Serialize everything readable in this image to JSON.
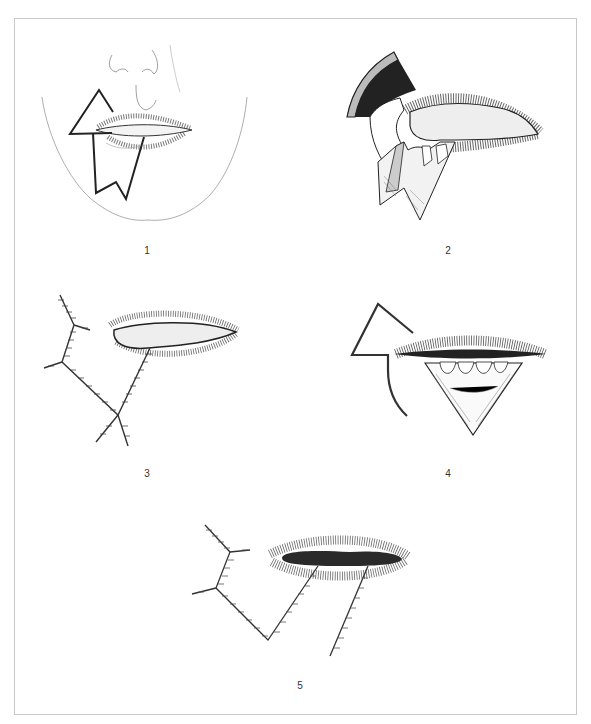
{
  "figure": {
    "panels": [
      {
        "id": 1,
        "label": "1",
        "content": "face outline with flap incision lines drawn around lower lip"
      },
      {
        "id": 2,
        "label": "2",
        "content": "flap rotated exposing teeth, upper lip everted"
      },
      {
        "id": 3,
        "label": "3",
        "content": "sutured closure lines beside lips"
      },
      {
        "id": 4,
        "label": "4",
        "content": "triangular wedge excision of lower lip with flap outline"
      },
      {
        "id": 5,
        "label": "5",
        "content": "final sutured closure with parallel suture lines below lips"
      }
    ],
    "colors": {
      "line": "#2a2a2a",
      "fill_dark": "#222222",
      "frame": "#c8c8c8",
      "hatch": "#555555"
    }
  }
}
